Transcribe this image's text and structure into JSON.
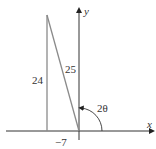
{
  "diagram": {
    "axes": {
      "x_label": "x",
      "y_label": "y"
    },
    "triangle": {
      "vertical_side": "24",
      "hypotenuse": "25",
      "horizontal_side": "−7"
    },
    "angle_label": "2θ",
    "colors": {
      "axis": "#333333",
      "triangle": "#8a8a8a"
    }
  }
}
